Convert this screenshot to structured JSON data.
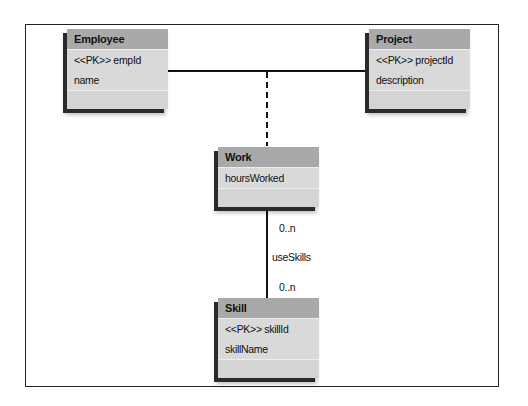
{
  "entities": {
    "employee": {
      "name": "Employee",
      "attributes": [
        "<<PK>> empId",
        "name"
      ]
    },
    "project": {
      "name": "Project",
      "attributes": [
        "<<PK>> projectId",
        "description"
      ]
    },
    "work": {
      "name": "Work",
      "attributes": [
        "hoursWorked"
      ]
    },
    "skill": {
      "name": "Skill",
      "attributes": [
        "<<PK>> skillId",
        "skillName"
      ]
    }
  },
  "relationships": {
    "employee_project": {
      "from": "Employee",
      "to": "Project",
      "style": "solid"
    },
    "association_class": {
      "class": "Work",
      "style": "dashed"
    },
    "work_skill": {
      "from": "Work",
      "to": "Skill",
      "style": "solid",
      "name": "useSkills",
      "from_multiplicity": "0..n",
      "to_multiplicity": "0..n"
    }
  },
  "colors": {
    "header": "#a9a9a9",
    "body": "#d9d9d9",
    "line": "#111111"
  }
}
